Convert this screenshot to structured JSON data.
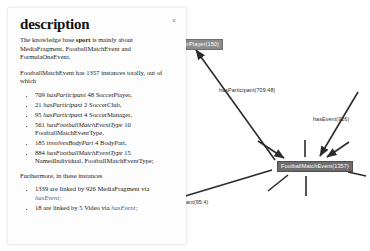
{
  "panel": {
    "title": "description",
    "close_label": "×",
    "intro": {
      "prefix": "The knowledge base ",
      "keyword": "sport",
      "suffix": " is mainly about MediaFragment, FootballMatchEvent and FormulaOneEvent."
    },
    "summary": "FootballMatchEvent has 1357 instances totally, out of which",
    "stats": [
      {
        "count": "709",
        "relation": "hasParticipant",
        "target_count": "48",
        "target": "SoccerPlayer,"
      },
      {
        "count": "21",
        "relation": "hasParticipant",
        "target_count": "2",
        "target": "SoccerClub,"
      },
      {
        "count": "95",
        "relation": "hasParticipant",
        "target_count": "4",
        "target": "SoccerManager,"
      },
      {
        "count": "561",
        "relation": "hasFootballMatchEventType",
        "target_count": "10",
        "target": "FootballMatchEventType,"
      },
      {
        "count": "185",
        "relation": "involvesBodyPart",
        "target_count": "4",
        "target": "BodyPart,"
      },
      {
        "count": "884",
        "relation": "hasFootballMatchEventType",
        "target_count": "15",
        "target": "NamedIndividual, FootballMatchEventType;"
      }
    ],
    "furthermore": "Furthermore, in these instances",
    "links": [
      {
        "count": "1339",
        "middle": "are linked by",
        "by_count": "926",
        "by_type": "MediaFragment",
        "via_word": "via",
        "relation": "hasEvent;"
      },
      {
        "count": "18",
        "middle": "are linked by",
        "by_count": "5",
        "by_type": "Video",
        "via_word": "via",
        "relation": "hasEvent;"
      }
    ]
  },
  "graph": {
    "nodes": [
      {
        "id": "soccer-player",
        "label": "SoccerPlayer(150)",
        "x": 167,
        "y": 41,
        "selected": false
      },
      {
        "id": "football-match-event",
        "label": "FootballMatchEvent(1357)",
        "x": 277,
        "y": 164,
        "selected": true
      }
    ],
    "edge_labels": [
      {
        "id": "has-participant-709",
        "label": "hasParticipant(709:48)",
        "x": 219,
        "y": 90
      },
      {
        "id": "has-event-926",
        "label": "hasEvent(926)",
        "x": 313,
        "y": 119
      },
      {
        "id": "has-participant-95",
        "label": "ant(95:4)",
        "x": 186,
        "y": 202
      }
    ],
    "colors": {
      "node_fill": "#8c8c8c",
      "node_selected_fill": "#6e6e6e",
      "edge_stroke": "#2b2b2b",
      "label_text": "#2b2b2b"
    }
  }
}
